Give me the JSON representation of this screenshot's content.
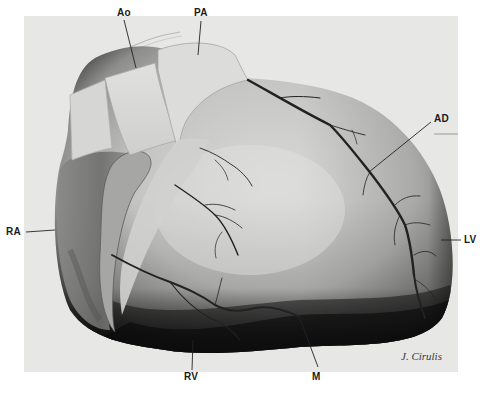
{
  "figure": {
    "type": "anatomical illustration",
    "background_panel_color": "#e7e7e5",
    "page_color": "#ffffff",
    "labels": [
      {
        "id": "ao",
        "text": "Ao",
        "x": 117,
        "y": 8
      },
      {
        "id": "pa",
        "text": "PA",
        "x": 194,
        "y": 8
      },
      {
        "id": "ad",
        "text": "AD",
        "x": 434,
        "y": 114
      },
      {
        "id": "ra",
        "text": "RA",
        "x": 6,
        "y": 227
      },
      {
        "id": "lv",
        "text": "LV",
        "x": 464,
        "y": 235
      },
      {
        "id": "rv",
        "text": "RV",
        "x": 184,
        "y": 372
      },
      {
        "id": "m",
        "text": "M",
        "x": 312,
        "y": 372
      }
    ],
    "signature": "J. Cirulis"
  }
}
